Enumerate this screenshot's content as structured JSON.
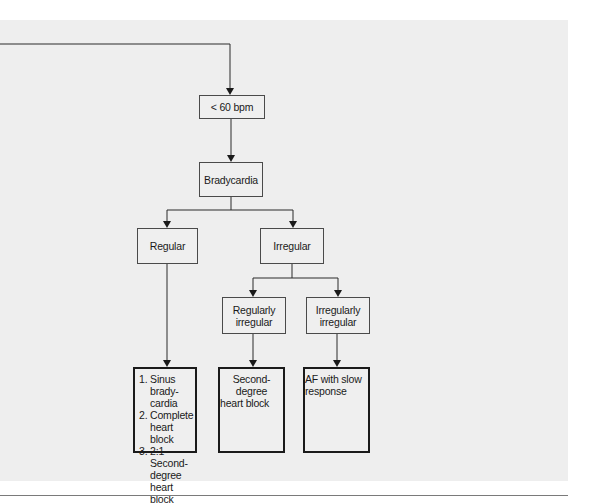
{
  "diagram": {
    "type": "flowchart",
    "nodes": {
      "rate": {
        "label": "< 60 bpm"
      },
      "bradycardia": {
        "label": "Bradycardia"
      },
      "regular": {
        "label": "Regular"
      },
      "irregular": {
        "label": "Irregular"
      },
      "regularly_irregular": {
        "line1": "Regularly",
        "line2": "irregular"
      },
      "irregularly_irregular": {
        "line1": "Irregularly",
        "line2": "irregular"
      },
      "outcome_regular": {
        "items": [
          "1. Sinus brady-cardia",
          "2. Complete heart block",
          "3. 2:1 Second-degree heart block"
        ]
      },
      "outcome_regularly_irregular": {
        "line1": "Second-degree",
        "line2": "heart block"
      },
      "outcome_irregularly_irregular": {
        "line1": "AF with slow",
        "line2": "response"
      }
    },
    "edges": [
      {
        "from": "incoming",
        "to": "rate"
      },
      {
        "from": "rate",
        "to": "bradycardia"
      },
      {
        "from": "bradycardia",
        "to": "regular"
      },
      {
        "from": "bradycardia",
        "to": "irregular"
      },
      {
        "from": "irregular",
        "to": "regularly_irregular"
      },
      {
        "from": "irregular",
        "to": "irregularly_irregular"
      },
      {
        "from": "regular",
        "to": "outcome_regular"
      },
      {
        "from": "regularly_irregular",
        "to": "outcome_regularly_irregular"
      },
      {
        "from": "irregularly_irregular",
        "to": "outcome_irregularly_irregular"
      }
    ]
  }
}
